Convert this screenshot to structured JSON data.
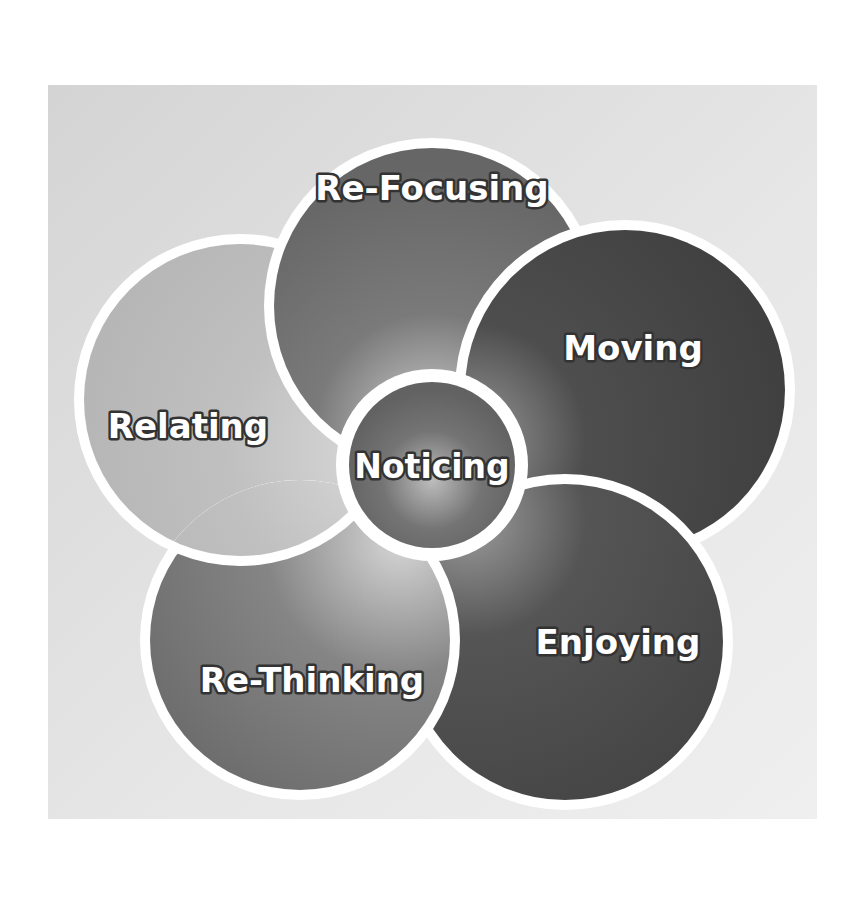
{
  "diagram": {
    "type": "pinwheel-cycle",
    "center": {
      "label": "Noticing",
      "fill": "#6a6a6a",
      "highlight": "#b5b5b5"
    },
    "petals": [
      {
        "id": "re-focusing",
        "label": "Re-Focusing",
        "fill": "#6e6e6e",
        "highlight": "#c8c8c8"
      },
      {
        "id": "moving",
        "label": "Moving",
        "fill": "#464646",
        "highlight": "#9a9a9a"
      },
      {
        "id": "enjoying",
        "label": "Enjoying",
        "fill": "#4c4c4c",
        "highlight": "#9c9c9c"
      },
      {
        "id": "re-thinking",
        "label": "Re-Thinking",
        "fill": "#7a7a7a",
        "highlight": "#cfcfcf"
      },
      {
        "id": "relating",
        "label": "Relating",
        "fill": "#bdbdbd",
        "highlight": "#d6d6d6"
      }
    ],
    "colors": {
      "background_top": "#d6d6d6",
      "background_bottom": "#ededed",
      "ring": "#ffffff",
      "label_fill": "#ffffff",
      "label_outline": "#333333"
    }
  }
}
